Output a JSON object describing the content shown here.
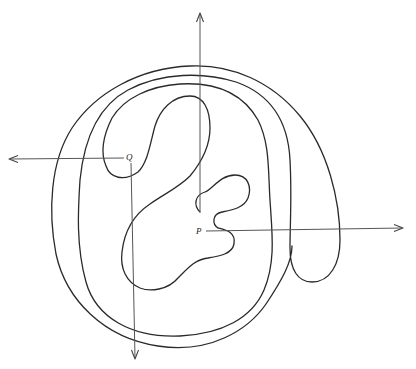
{
  "diagram": {
    "points": [
      {
        "id": "P",
        "label": "P",
        "x": 200,
        "y": 232
      },
      {
        "id": "Q",
        "label": "Q",
        "x": 131,
        "y": 157
      }
    ],
    "rays": [
      {
        "from": "P",
        "direction": "right",
        "label": ""
      },
      {
        "from": "P",
        "direction": "up",
        "label": ""
      },
      {
        "from": "Q",
        "direction": "left",
        "label": ""
      },
      {
        "from": "Q",
        "direction": "down",
        "label": ""
      }
    ],
    "colors": {
      "curve": "#2a2a2a",
      "ray": "#555555",
      "background": "#ffffff"
    }
  }
}
